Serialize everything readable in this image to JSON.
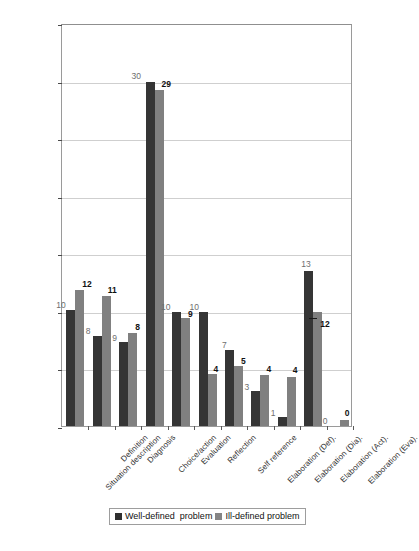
{
  "chart_data": {
    "type": "bar",
    "title": "",
    "subtitle": "",
    "xlabel": "",
    "ylabel": "",
    "ylim": [
      0,
      35
    ],
    "ytick_step": 5,
    "yticks": [
      "0",
      "5",
      "10",
      "15",
      "20",
      "25",
      "30",
      "35"
    ],
    "grid": true,
    "legend_position": "bottom-center",
    "categories": [
      "Situation description",
      "Definition",
      "Diagnosis",
      "Choice/action",
      "Evaluation",
      "Reflection",
      "Self reference",
      "Elaboration (Def).",
      "Elaboration (Dia).",
      "Elaboration (Act).",
      "Elaboration (Eva)."
    ],
    "series": [
      {
        "name": "Well-defined  problem",
        "color": "#353535",
        "values": [
          10,
          8,
          9,
          30,
          10,
          10,
          7,
          3,
          1,
          13,
          0
        ],
        "bar_heights": [
          10.1,
          7.8,
          7.3,
          29.9,
          9.9,
          9.9,
          6.6,
          3.0,
          0.8,
          13.5,
          0
        ]
      },
      {
        "name": "Ill-defined problem",
        "color": "#808080",
        "values": [
          12,
          11,
          8,
          29,
          9,
          4,
          5,
          4,
          4,
          12,
          0
        ],
        "bar_heights": [
          11.8,
          11.3,
          8.1,
          29.2,
          9.4,
          4.5,
          5.2,
          4.4,
          4.3,
          9.9,
          0.5
        ]
      }
    ]
  },
  "legend": {
    "entries": [
      {
        "label": "Well-defined  problem",
        "swatch": "dark-gray-swatch"
      },
      {
        "label": "Ill-defined problem",
        "swatch": "medium-gray-swatch"
      }
    ]
  }
}
